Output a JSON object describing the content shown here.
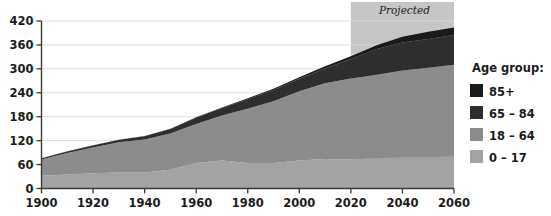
{
  "chart_data": {
    "type": "area",
    "stacked": true,
    "title": "",
    "xlabel": "",
    "ylabel": "",
    "x": [
      1900,
      1910,
      1920,
      1930,
      1940,
      1950,
      1960,
      1970,
      1980,
      1990,
      2000,
      2010,
      2020,
      2030,
      2040,
      2050,
      2060
    ],
    "xlim": [
      1900,
      2060
    ],
    "ylim": [
      0,
      420
    ],
    "xticks": [
      1900,
      1920,
      1940,
      1960,
      1980,
      2000,
      2020,
      2040,
      2060
    ],
    "xtick_labels": [
      "1900",
      "1920",
      "1940",
      "1960",
      "1980",
      "2000",
      "2020",
      "2040",
      "2060"
    ],
    "yticks": [
      0,
      60,
      120,
      180,
      240,
      300,
      360,
      420
    ],
    "ytick_labels": [
      "0",
      "60",
      "120",
      "180",
      "240",
      "300",
      "360",
      "420"
    ],
    "grid": "horizontal",
    "legend_position": "right",
    "legend_title": "Age group:",
    "series": [
      {
        "name": "0 – 17",
        "color": "#a3a3a3",
        "values": [
          32,
          35,
          38,
          40,
          40,
          47,
          64,
          70,
          64,
          64,
          70,
          74,
          73,
          76,
          78,
          79,
          80
        ]
      },
      {
        "name": "18 – 64",
        "color": "#8c8c8c",
        "values": [
          41,
          54,
          65,
          76,
          83,
          91,
          98,
          113,
          136,
          155,
          174,
          190,
          203,
          209,
          218,
          224,
          230
        ]
      },
      {
        "name": "65 – 84",
        "color": "#2e2e2e",
        "values": [
          3,
          4,
          5,
          6,
          8,
          11,
          16,
          19,
          24,
          28,
          31,
          37,
          49,
          65,
          70,
          72,
          75
        ]
      },
      {
        "name": "85+",
        "color": "#1a1a1a",
        "values": [
          0.1,
          0.2,
          0.2,
          0.3,
          0.4,
          0.6,
          0.9,
          1.4,
          2.2,
          3.0,
          4.2,
          5.5,
          6.7,
          9.1,
          14.4,
          18.0,
          19.0
        ]
      }
    ],
    "annotations": [
      {
        "text": "Projected",
        "x_start": 2020,
        "x_end": 2060,
        "style": "italic",
        "shaded": true
      }
    ],
    "shaded_region_color": "#b0b0b0"
  },
  "legend": {
    "title": "Age group:",
    "items": [
      {
        "label": "85+",
        "color": "#1a1a1a"
      },
      {
        "label": "65 – 84",
        "color": "#2e2e2e"
      },
      {
        "label": "18 – 64",
        "color": "#8c8c8c"
      },
      {
        "label": "0 – 17",
        "color": "#a3a3a3"
      }
    ]
  },
  "axes": {
    "x_tick_labels": [
      "1900",
      "1920",
      "1940",
      "1960",
      "1980",
      "2000",
      "2020",
      "2040",
      "2060"
    ],
    "y_tick_labels": [
      "420",
      "360",
      "300",
      "240",
      "180",
      "120",
      "60",
      "0"
    ]
  },
  "projected": {
    "label": "Projected"
  },
  "colors": {
    "background": "#ffffff",
    "axis": "#3a3a3a",
    "grid": "#d9d9d9",
    "text": "#1b1b1b",
    "projection_shade": "#b0b0b0"
  }
}
